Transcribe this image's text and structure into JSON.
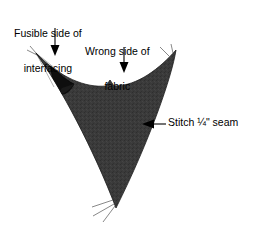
{
  "diagram": {
    "type": "sewing-instruction-illustration",
    "background_color": "#ffffff",
    "fabric_fill_color": "#3a3a3a",
    "fabric_fold_color": "#101010",
    "outline_color": "#000000",
    "text_color": "#000000",
    "labels": {
      "fusible": {
        "line1": "Fusible side of",
        "line2": "interfacing"
      },
      "wrong_side": {
        "line1": "Wrong side of",
        "line2": "fabric"
      },
      "stitch": {
        "text": "Stitch ¼\" seam"
      }
    },
    "annotations": {
      "arrow_fusible": "down-arrow-icon",
      "arrow_wrong_side": "down-arrow-icon",
      "arrow_stitch": "left-arrow-icon",
      "threads_top_left": "thread-tails",
      "threads_top_right": "thread-tails",
      "threads_bottom": "thread-tails"
    }
  }
}
